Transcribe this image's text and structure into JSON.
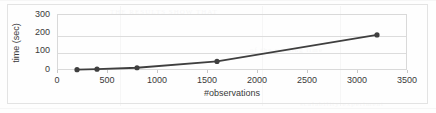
{
  "chart_data": {
    "type": "line",
    "title": "",
    "xlabel": "#observations",
    "ylabel": "time (sec)",
    "xlim": [
      0,
      3500
    ],
    "ylim": [
      0,
      300
    ],
    "xticks": [
      0,
      500,
      1000,
      1500,
      2000,
      2500,
      3000,
      3500
    ],
    "yticks": [
      0,
      100,
      200,
      300
    ],
    "xtick_labels": [
      "0",
      "500",
      "1000",
      "1500",
      "2000",
      "2500",
      "3000",
      "3500"
    ],
    "ytick_labels": [
      "0",
      "100",
      "200",
      "300"
    ],
    "grid": "horizontal",
    "legend": "none",
    "series": [
      {
        "name": "runtime",
        "color": "#3f3f3f",
        "marker": "circle",
        "x": [
          200,
          400,
          800,
          1600,
          3200
        ],
        "values": [
          2,
          5,
          13,
          50,
          205
        ]
      }
    ]
  },
  "figure": {
    "border_color": "#e3e3e3",
    "plot_border_color": "#d9d9d9",
    "gridline_color": "#dcdcdc",
    "text_color": "#3a3a3a",
    "background": "#fefefe"
  },
  "artifacts": {
    "bleed_text_1": "THE RESULTS SHOW THAT",
    "bleed_text_2": "of the running time",
    "bleed_text_3": "scalability experiment"
  }
}
